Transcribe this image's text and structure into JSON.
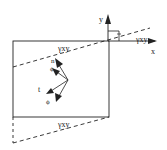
{
  "diagram": {
    "type": "shear strain deformation diagram",
    "axes": {
      "x_label": "x",
      "y_label": "y"
    },
    "labels": {
      "gamma_top": "γxy",
      "gamma_bottom": "γxy",
      "gamma_axis": "γxy",
      "normal": "n",
      "tangent": "t",
      "phi_upper": "ϕ",
      "phi_lower": "ϕ"
    },
    "colors": {
      "line": "#222222",
      "background": "#ffffff"
    }
  }
}
